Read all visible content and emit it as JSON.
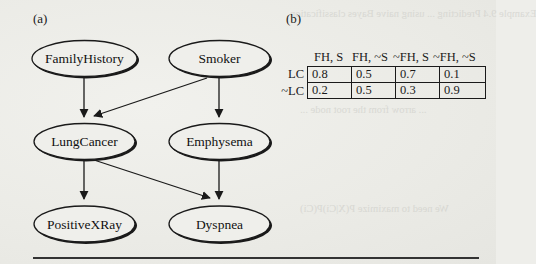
{
  "panels": {
    "a": {
      "label": "(a)"
    },
    "b": {
      "label": "(b)"
    }
  },
  "network": {
    "nodes": [
      {
        "id": "FamilyHistory",
        "label": "FamilyHistory",
        "cx": 85,
        "cy": 59
      },
      {
        "id": "Smoker",
        "label": "Smoker",
        "cx": 219,
        "cy": 59
      },
      {
        "id": "LungCancer",
        "label": "LungCancer",
        "cx": 85,
        "cy": 142
      },
      {
        "id": "Emphysema",
        "label": "Emphysema",
        "cx": 219,
        "cy": 142
      },
      {
        "id": "PositiveXRay",
        "label": "PositiveXRay",
        "cx": 85,
        "cy": 224
      },
      {
        "id": "Dyspnea",
        "label": "Dyspnea",
        "cx": 219,
        "cy": 224
      }
    ],
    "edges": [
      {
        "from": "FamilyHistory",
        "to": "LungCancer"
      },
      {
        "from": "Smoker",
        "to": "LungCancer"
      },
      {
        "from": "Smoker",
        "to": "Emphysema"
      },
      {
        "from": "LungCancer",
        "to": "PositiveXRay"
      },
      {
        "from": "LungCancer",
        "to": "Dyspnea"
      },
      {
        "from": "Emphysema",
        "to": "Dyspnea"
      }
    ]
  },
  "cpt": {
    "columns": [
      "FH, S",
      "FH, ~S",
      "~FH, S",
      "~FH, ~S"
    ],
    "rows": [
      {
        "label": "LC",
        "values": [
          "0.8",
          "0.5",
          "0.7",
          "0.1"
        ]
      },
      {
        "label": "~LC",
        "values": [
          "0.2",
          "0.5",
          "0.3",
          "0.9"
        ]
      }
    ]
  }
}
